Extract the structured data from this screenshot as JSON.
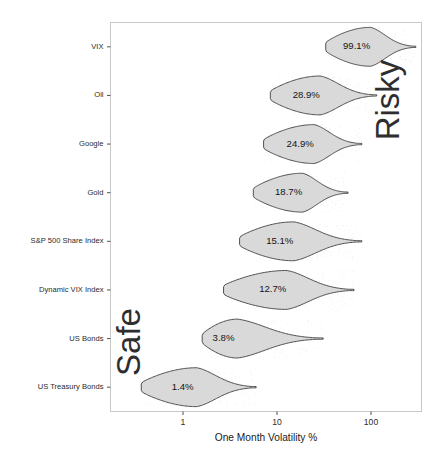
{
  "chart_data": {
    "type": "violin",
    "title": "",
    "xlabel": "One Month Volatility %",
    "ylabel": "",
    "xscale": "log",
    "xlim": [
      0.3,
      300
    ],
    "xticks": [
      1,
      10,
      100
    ],
    "xticklabels": [
      "1",
      "10",
      "100"
    ],
    "grid": false,
    "legend": false,
    "orientation": "horizontal",
    "categories": [
      "VIX",
      "Oil",
      "Google",
      "Gold",
      "S&P 500 Share Index",
      "Dynamic VIX Index",
      "US Bonds",
      "US Treasury Bonds"
    ],
    "values": [
      99.1,
      28.9,
      24.9,
      18.7,
      15.1,
      12.7,
      3.8,
      1.4
    ],
    "value_labels": [
      "99.1%",
      "28.9%",
      "24.9%",
      "18.7%",
      "15.1%",
      "12.7%",
      "3.8%",
      "1.4%"
    ],
    "series": [
      {
        "name": "VIX",
        "label": "99.1%",
        "median": 99.1,
        "min": 33,
        "max": 300,
        "peak": 99.1
      },
      {
        "name": "Oil",
        "label": "28.9%",
        "median": 28.9,
        "min": 8.5,
        "max": 115,
        "peak": 28.9
      },
      {
        "name": "Google",
        "label": "24.9%",
        "median": 24.9,
        "min": 7.2,
        "max": 80,
        "peak": 24.9
      },
      {
        "name": "Gold",
        "label": "18.7%",
        "median": 18.7,
        "min": 5.6,
        "max": 57,
        "peak": 18.7
      },
      {
        "name": "S&P 500 Share Index",
        "label": "15.1%",
        "median": 15.1,
        "min": 4.0,
        "max": 80,
        "peak": 15.1
      },
      {
        "name": "Dynamic VIX Index",
        "label": "12.7%",
        "median": 12.7,
        "min": 2.7,
        "max": 66,
        "peak": 12.7
      },
      {
        "name": "US Bonds",
        "label": "3.8%",
        "median": 3.8,
        "min": 1.6,
        "max": 31,
        "peak": 3.8
      },
      {
        "name": "US Treasury Bonds",
        "label": "1.4%",
        "median": 1.4,
        "min": 0.36,
        "max": 6.0,
        "peak": 1.4
      }
    ],
    "annotations": [
      {
        "text": "Risky",
        "position": "top-right",
        "rotation": -90
      },
      {
        "text": "Safe",
        "position": "bottom-left",
        "rotation": -90
      }
    ],
    "colors": {
      "violin_fill": "#d9d9d9",
      "violin_stroke": "#3d3d3d",
      "panel_border": "#c8c8c8",
      "background": "#ffffff",
      "text": "#2b2b2b"
    }
  }
}
